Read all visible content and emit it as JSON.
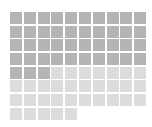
{
  "chart_data": {
    "type": "waffle",
    "title": "",
    "columns": 10,
    "total": 75,
    "series": [
      {
        "name": "filled",
        "value": 43,
        "color": "#b4b4b4"
      },
      {
        "name": "remaining",
        "value": 32,
        "color": "#dcdcdc"
      }
    ],
    "categories": [
      "filled",
      "remaining"
    ],
    "values": [
      43,
      32
    ],
    "legend": null
  }
}
